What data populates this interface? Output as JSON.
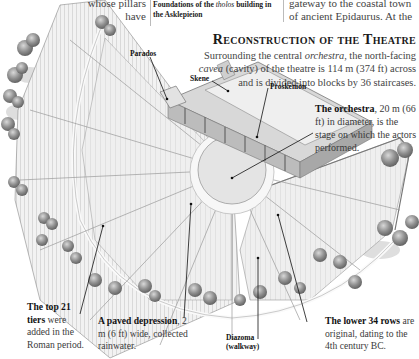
{
  "page": {
    "top_fragment_left": [
      "whose pillars",
      "have"
    ],
    "top_caption": {
      "prefix": "Foundations of the ",
      "italic": "tholos",
      "suffix": " building in the Asklepieion"
    },
    "top_fragment_right": [
      "gateway to the coastal town",
      "of ancient Epidaurus. At the"
    ]
  },
  "section": {
    "title": "Reconstruction of the Theatre",
    "body": {
      "p1": "Surrounding the central ",
      "orchestra_italic": "orchestra",
      "p2": ", the north-facing",
      "cavea_italic": "cavea",
      "p3": " (cavity) of the theatre is 114 m (374 ft) across",
      "p4": "and is divided into blocks by 36 staircases."
    }
  },
  "labels": {
    "parados": "Parados",
    "skene": "Skene",
    "proskenion": "Proskenion",
    "diazoma": [
      "Diazoma",
      "(walkway)"
    ]
  },
  "annotations": {
    "orchestra": {
      "bold": "The orchestra",
      "text": ", 20 m (66 ft) in diameter, is the stage on which the actors performed."
    },
    "top21": {
      "bold": "The top 21 tiers",
      "text": " were added in the Roman period."
    },
    "paved": {
      "bold": "A paved depression",
      "text": ", 2 m (6 ft) wide, collected rainwater."
    },
    "lower34": {
      "bold": "The lower 34 rows",
      "text": " are original, dating to the 4th century BC."
    }
  },
  "colors": {
    "ink": "#111111",
    "body_text": "#444444",
    "stone_light": "#ececec",
    "stone_mid": "#cfcfcf",
    "tree": "#8a8a8a"
  }
}
